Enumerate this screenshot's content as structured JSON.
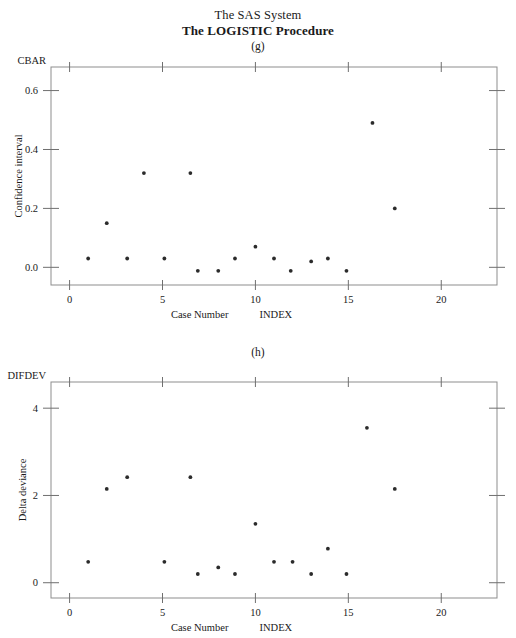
{
  "header": {
    "title": "The SAS System",
    "procedure": "The LOGISTIC Procedure"
  },
  "panels": [
    {
      "letter": "(g)",
      "y_variable": "CBAR",
      "y_axis_title": "Confidence interval",
      "x_axis_title_left": "Case Number",
      "x_axis_title_right": "INDEX"
    },
    {
      "letter": "(h)",
      "y_variable": "DIFDEV",
      "y_axis_title": "Delta deviance",
      "x_axis_title_left": "Case Number",
      "x_axis_title_right": "INDEX"
    }
  ],
  "chart_data": [
    {
      "type": "scatter",
      "title": "(g)",
      "xlabel": "Case Number   INDEX",
      "ylabel": "Confidence interval",
      "y_variable": "CBAR",
      "xlim": [
        -1,
        23
      ],
      "ylim": [
        -0.06,
        0.68
      ],
      "xticks": [
        0,
        5,
        10,
        15,
        20
      ],
      "yticks": [
        0.0,
        0.2,
        0.4,
        0.6
      ],
      "xtick_labels": [
        "0",
        "5",
        "10",
        "15",
        "20"
      ],
      "ytick_labels": [
        "0.0",
        "0.2",
        "0.4",
        "0.6"
      ],
      "grid": false,
      "legend": false,
      "points": [
        {
          "x": 1.0,
          "y": 0.03
        },
        {
          "x": 2.0,
          "y": 0.15
        },
        {
          "x": 3.1,
          "y": 0.03
        },
        {
          "x": 4.0,
          "y": 0.32
        },
        {
          "x": 5.1,
          "y": 0.03
        },
        {
          "x": 6.5,
          "y": 0.32
        },
        {
          "x": 6.9,
          "y": -0.012
        },
        {
          "x": 8.0,
          "y": -0.012
        },
        {
          "x": 8.9,
          "y": 0.03
        },
        {
          "x": 10.0,
          "y": 0.07
        },
        {
          "x": 11.0,
          "y": 0.03
        },
        {
          "x": 11.9,
          "y": -0.012
        },
        {
          "x": 13.0,
          "y": 0.02
        },
        {
          "x": 13.9,
          "y": 0.03
        },
        {
          "x": 14.9,
          "y": -0.012
        },
        {
          "x": 16.3,
          "y": 0.49
        },
        {
          "x": 17.5,
          "y": 0.2
        }
      ]
    },
    {
      "type": "scatter",
      "title": "(h)",
      "xlabel": "Case Number   INDEX",
      "ylabel": "Delta deviance",
      "y_variable": "DIFDEV",
      "xlim": [
        -1,
        23
      ],
      "ylim": [
        -0.35,
        4.6
      ],
      "xticks": [
        0,
        5,
        10,
        15,
        20
      ],
      "yticks": [
        0,
        2,
        4
      ],
      "xtick_labels": [
        "0",
        "5",
        "10",
        "15",
        "20"
      ],
      "ytick_labels": [
        "0",
        "2",
        "4"
      ],
      "grid": false,
      "legend": false,
      "points": [
        {
          "x": 1.0,
          "y": 0.48
        },
        {
          "x": 2.0,
          "y": 2.15
        },
        {
          "x": 3.1,
          "y": 2.42
        },
        {
          "x": 5.1,
          "y": 0.48
        },
        {
          "x": 6.5,
          "y": 2.42
        },
        {
          "x": 6.9,
          "y": 0.2
        },
        {
          "x": 8.0,
          "y": 0.35
        },
        {
          "x": 8.9,
          "y": 0.2
        },
        {
          "x": 10.0,
          "y": 1.35
        },
        {
          "x": 11.0,
          "y": 0.48
        },
        {
          "x": 12.0,
          "y": 0.48
        },
        {
          "x": 13.0,
          "y": 0.2
        },
        {
          "x": 13.9,
          "y": 0.78
        },
        {
          "x": 14.9,
          "y": 0.2
        },
        {
          "x": 16.0,
          "y": 3.55
        },
        {
          "x": 17.5,
          "y": 2.15
        }
      ]
    }
  ]
}
